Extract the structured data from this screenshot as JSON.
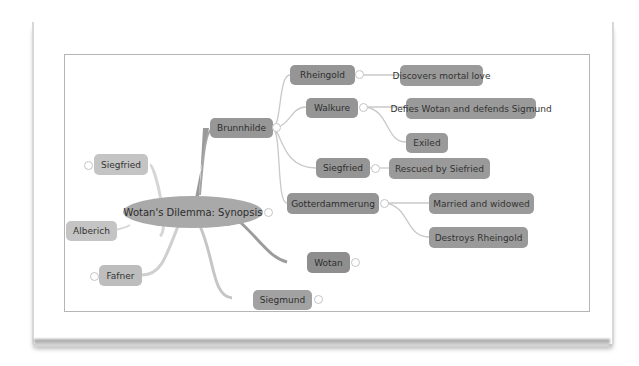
{
  "diagram": {
    "type": "mind-map",
    "central_topic": "Wotan's Dilemma: Synopsis",
    "colors": {
      "node_dark": "#969696",
      "node_light": "#c4c4c4",
      "central": "#a9a9a9",
      "link": "#c8c8c8",
      "frame_border": "#b5b5b5"
    },
    "left_branches": {
      "siegfried": "Siegfried",
      "alberich": "Alberich",
      "fafner": "Fafner"
    },
    "right_branches": {
      "brunnhilde": {
        "label": "Brunnhilde",
        "children": {
          "rheingold": {
            "label": "Rheingold",
            "outcome": "Discovers mortal love"
          },
          "walkure": {
            "label": "Walkure",
            "outcomes": [
              "Defies Wotan and defends Sigmund",
              "Exiled"
            ]
          },
          "siegfried": {
            "label": "Siegfried",
            "outcome": "Rescued by Siefried"
          },
          "gotterdammerung": {
            "label": "Gotterdammerung",
            "outcomes": [
              "Married and widowed",
              "Destroys Rheingold"
            ]
          }
        }
      },
      "wotan": "Wotan",
      "siegmund": "Siegmund"
    },
    "toggle_symbol": "⊖",
    "collapsed_symbol": "⊕"
  }
}
